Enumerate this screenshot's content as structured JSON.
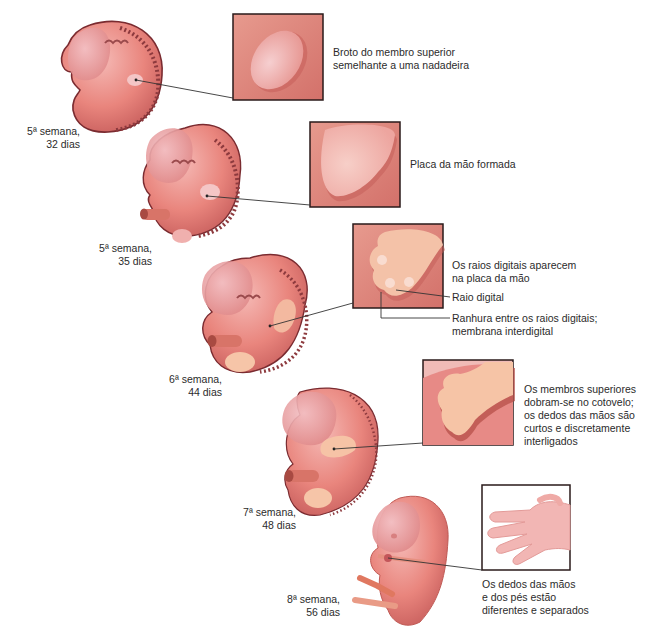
{
  "figure": {
    "colors": {
      "embryo_skin": "#e9857d",
      "embryo_light": "#f4b3ad",
      "embryo_outline": "#7a2b30",
      "box_bg": "#e0837a",
      "box_border": "#2a1a1a",
      "hand_plate": "#f6c3b8",
      "leader_line": "#333333"
    },
    "stages": [
      {
        "id": "stage-1",
        "age": [
          "5ª semana,",
          "32 dias"
        ],
        "description": [
          "Broto do membro superior",
          "semelhante a uma nadadeira"
        ]
      },
      {
        "id": "stage-2",
        "age": [
          "5ª semana,",
          "35 dias"
        ],
        "description": [
          "Placa da mão formada"
        ]
      },
      {
        "id": "stage-3",
        "age": [
          "6ª semana,",
          "44 dias"
        ],
        "description": [
          "Os raios digitais aparecem",
          "na placa da mão"
        ],
        "callouts": [
          {
            "label": [
              "Raio digital"
            ]
          },
          {
            "label": [
              "Ranhura entre os raios digitais;",
              "membrana interdigital"
            ]
          }
        ]
      },
      {
        "id": "stage-4",
        "age": [
          "7ª semana,",
          "48 dias"
        ],
        "description": [
          "Os membros superiores",
          "dobram-se no cotovelo;",
          "os dedos das mãos são",
          "curtos e discretamente",
          "interligados"
        ]
      },
      {
        "id": "stage-5",
        "age": [
          "8ª semana,",
          "56 dias"
        ],
        "description": [
          "Os dedos das mãos",
          "e dos pés estão",
          "diferentes e separados"
        ]
      }
    ]
  }
}
